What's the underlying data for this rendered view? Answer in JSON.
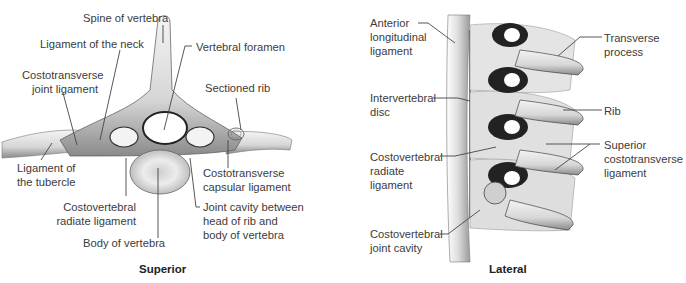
{
  "panels": [
    {
      "id": "superior",
      "caption": "Superior",
      "labels": {
        "spine_of_vertebra": "Spine of vertebra",
        "ligament_of_the_neck": "Ligament of the neck",
        "vertebral_foramen": "Vertebral foramen",
        "costotransverse_joint_ligament_1": "Costotransverse",
        "costotransverse_joint_ligament_2": "joint ligament",
        "sectioned_rib": "Sectioned rib",
        "ligament_of_tubercle_1": "Ligament of",
        "ligament_of_tubercle_2": "the tubercle",
        "costotransverse_capsular_1": "Costotransverse",
        "costotransverse_capsular_2": "capsular ligament",
        "costovertebral_radiate_1": "Costovertebral",
        "costovertebral_radiate_2": "radiate ligament",
        "joint_cavity_1": "Joint cavity between",
        "joint_cavity_2": "head of rib and",
        "joint_cavity_3": "body of vertebra",
        "body_of_vertebra": "Body of vertebra"
      }
    },
    {
      "id": "lateral",
      "caption": "Lateral",
      "labels": {
        "anterior_longitudinal_1": "Anterior",
        "anterior_longitudinal_2": "longitudinal",
        "anterior_longitudinal_3": "ligament",
        "intervertebral_disc_1": "Intervertebral",
        "intervertebral_disc_2": "disc",
        "costovertebral_radiate_1": "Costovertebral",
        "costovertebral_radiate_2": "radiate",
        "costovertebral_radiate_3": "ligament",
        "costovertebral_joint_cavity_1": "Costovertebral",
        "costovertebral_joint_cavity_2": "joint cavity",
        "transverse_process_1": "Transverse",
        "transverse_process_2": "process",
        "rib": "Rib",
        "superior_costotransverse_1": "Superior",
        "superior_costotransverse_2": "costotransverse",
        "superior_costotransverse_3": "ligament"
      }
    }
  ]
}
